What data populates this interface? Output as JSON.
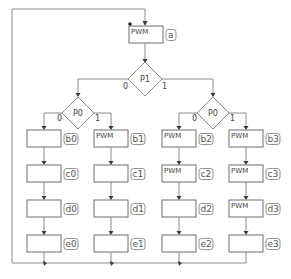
{
  "diagram": {
    "start": {
      "label": "PWM",
      "tag": "a"
    },
    "decision_root": {
      "label": "P1",
      "branch_left": "0",
      "branch_right": "1"
    },
    "decision_left": {
      "label": "P0",
      "branch_left": "0",
      "branch_right": "1"
    },
    "decision_right": {
      "label": "P0",
      "branch_left": "0",
      "branch_right": "1"
    },
    "columns": [
      {
        "nodes": [
          {
            "tag": "b0",
            "text": ""
          },
          {
            "tag": "c0",
            "text": ""
          },
          {
            "tag": "d0",
            "text": ""
          },
          {
            "tag": "e0",
            "text": ""
          }
        ]
      },
      {
        "nodes": [
          {
            "tag": "b1",
            "text": "PWM"
          },
          {
            "tag": "c1",
            "text": ""
          },
          {
            "tag": "d1",
            "text": ""
          },
          {
            "tag": "e1",
            "text": ""
          }
        ]
      },
      {
        "nodes": [
          {
            "tag": "b2",
            "text": "PWM"
          },
          {
            "tag": "c2",
            "text": "PWM"
          },
          {
            "tag": "d2",
            "text": ""
          },
          {
            "tag": "e2",
            "text": ""
          }
        ]
      },
      {
        "nodes": [
          {
            "tag": "b3",
            "text": "PWM"
          },
          {
            "tag": "c3",
            "text": "PWM"
          },
          {
            "tag": "d3",
            "text": "PWM"
          },
          {
            "tag": "e3",
            "text": ""
          }
        ]
      }
    ]
  }
}
